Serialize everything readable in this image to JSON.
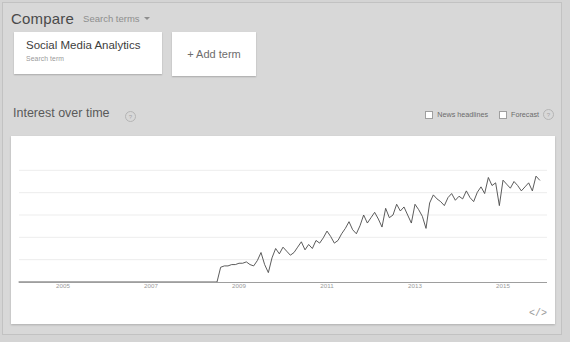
{
  "header": {
    "compare_label": "Compare",
    "dropdown_label": "Search terms",
    "caret_icon": "chevron-down-icon"
  },
  "terms": {
    "cards": [
      {
        "label": "Social Media Analytics",
        "sublabel": "Search term"
      }
    ],
    "add_label": "+ Add term"
  },
  "interest": {
    "title": "Interest over time",
    "help_icon": "?",
    "controls": [
      {
        "label": "News headlines",
        "checked": false
      },
      {
        "label": "Forecast",
        "checked": false
      }
    ],
    "forecast_help_icon": "?",
    "embed_icon": "</>"
  },
  "chart_data": {
    "type": "line",
    "title": "Interest over time",
    "xlabel": "",
    "ylabel": "",
    "grid": true,
    "legend": false,
    "ylim": [
      0,
      100
    ],
    "xlim": [
      2004,
      2016
    ],
    "xtick_labels": [
      "2005",
      "2007",
      "2009",
      "2011",
      "2013",
      "2015"
    ],
    "xtick_values": [
      2005,
      2007,
      2009,
      2011,
      2013,
      2015
    ],
    "line_color": "#4a4a4a",
    "gridline_color": "#ededed",
    "series": [
      {
        "name": "Social Media Analytics",
        "x": [
          2004.0,
          2004.25,
          2004.5,
          2004.75,
          2005.0,
          2005.25,
          2005.5,
          2005.75,
          2006.0,
          2006.25,
          2006.5,
          2006.75,
          2007.0,
          2007.25,
          2007.5,
          2007.75,
          2008.0,
          2008.25,
          2008.5,
          2008.583,
          2008.667,
          2008.75,
          2008.833,
          2008.917,
          2009.0,
          2009.083,
          2009.167,
          2009.25,
          2009.333,
          2009.417,
          2009.5,
          2009.583,
          2009.667,
          2009.75,
          2009.833,
          2009.917,
          2010.0,
          2010.083,
          2010.167,
          2010.25,
          2010.333,
          2010.417,
          2010.5,
          2010.583,
          2010.667,
          2010.75,
          2010.833,
          2010.917,
          2011.0,
          2011.083,
          2011.167,
          2011.25,
          2011.333,
          2011.417,
          2011.5,
          2011.583,
          2011.667,
          2011.75,
          2011.833,
          2011.917,
          2012.0,
          2012.083,
          2012.167,
          2012.25,
          2012.333,
          2012.417,
          2012.5,
          2012.583,
          2012.667,
          2012.75,
          2012.833,
          2012.917,
          2013.0,
          2013.083,
          2013.167,
          2013.25,
          2013.333,
          2013.417,
          2013.5,
          2013.583,
          2013.667,
          2013.75,
          2013.833,
          2013.917,
          2014.0,
          2014.083,
          2014.167,
          2014.25,
          2014.333,
          2014.417,
          2014.5,
          2014.583,
          2014.667,
          2014.75,
          2014.833,
          2014.917,
          2015.0,
          2015.083,
          2015.167,
          2015.25,
          2015.333,
          2015.417,
          2015.5,
          2015.583,
          2015.667,
          2015.75,
          2015.833
        ],
        "values": [
          0,
          0,
          0,
          0,
          0,
          0,
          0,
          0,
          0,
          0,
          0,
          0,
          0,
          0,
          0,
          0,
          0,
          0,
          0,
          11,
          12,
          12,
          13,
          13,
          14,
          14,
          15,
          13,
          12,
          16,
          22,
          13,
          7,
          18,
          25,
          21,
          26,
          23,
          20,
          22,
          26,
          30,
          24,
          28,
          25,
          31,
          29,
          33,
          38,
          34,
          29,
          31,
          36,
          40,
          45,
          39,
          36,
          42,
          50,
          44,
          48,
          52,
          47,
          41,
          55,
          48,
          50,
          58,
          53,
          56,
          50,
          44,
          58,
          54,
          49,
          40,
          59,
          65,
          62,
          60,
          57,
          63,
          66,
          61,
          64,
          62,
          68,
          63,
          60,
          67,
          71,
          66,
          78,
          72,
          74,
          57,
          76,
          73,
          70,
          75,
          72,
          68,
          71,
          74,
          68,
          79,
          76
        ]
      }
    ]
  }
}
